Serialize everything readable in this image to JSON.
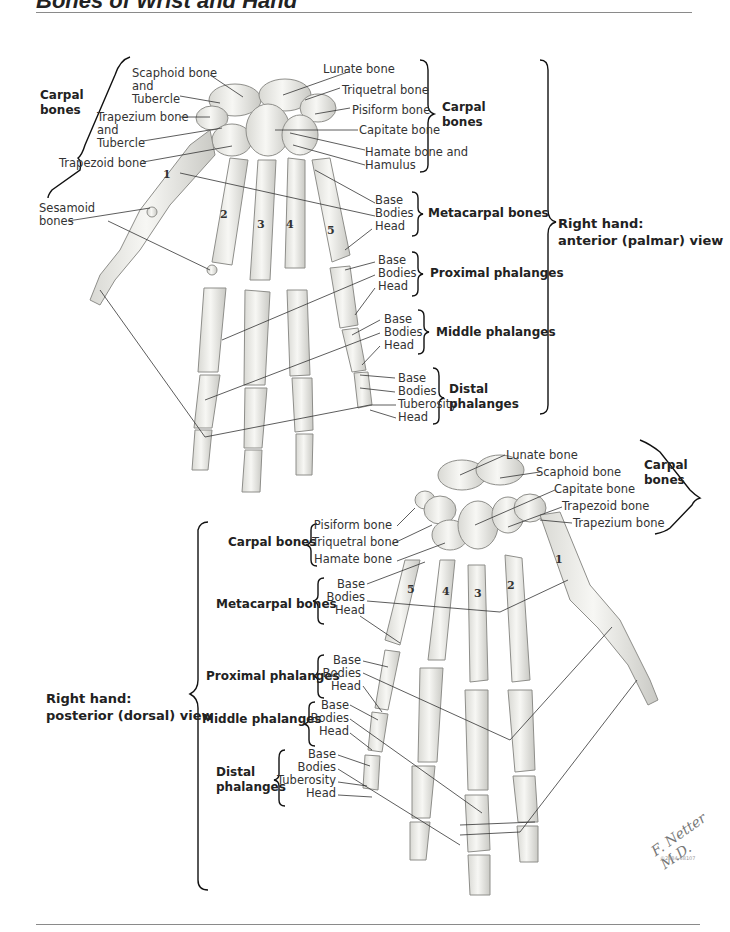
{
  "header": {
    "title": "Bones of Wrist and Hand"
  },
  "anterior_view": {
    "view_label": [
      "Right hand:",
      "anterior (palmar) view"
    ],
    "left_group": {
      "title": [
        "Carpal",
        "bones"
      ]
    },
    "left_labels": [
      "Scaphoid bone",
      "and",
      "Tubercle",
      "Trapezium bone",
      "and",
      "Tubercle",
      "Trapezoid bone",
      "Sesamoid",
      "bones"
    ],
    "right_labels": {
      "carpal": [
        "Lunate bone",
        "Triquetral bone",
        "Pisiform bone",
        "Capitate bone",
        "Hamate bone and",
        "Hamulus"
      ],
      "carpal_group": [
        "Carpal",
        "bones"
      ],
      "metacarpal": [
        "Base",
        "Bodies",
        "Head"
      ],
      "metacarpal_group": "Metacarpal bones",
      "proximal": [
        "Base",
        "Bodies",
        "Head"
      ],
      "proximal_group": "Proximal phalanges",
      "middle": [
        "Base",
        "Bodies",
        "Head"
      ],
      "middle_group": "Middle phalanges",
      "distal": [
        "Base",
        "Bodies",
        "Tuberosity",
        "Head"
      ],
      "distal_group": [
        "Distal",
        "phalanges"
      ]
    },
    "digit_numbers": [
      "1",
      "2",
      "3",
      "4",
      "5"
    ]
  },
  "posterior_view": {
    "view_label": [
      "Right hand:",
      "posterior (dorsal) view"
    ],
    "top_right_labels": [
      "Lunate bone",
      "Scaphoid bone",
      "Capitate bone",
      "Trapezoid bone",
      "Trapezium bone"
    ],
    "top_right_group": [
      "Carpal",
      "bones"
    ],
    "carpal_group": "Carpal bones",
    "carpal": [
      "Pisiform bone",
      "Triquetral bone",
      "Hamate bone"
    ],
    "metacarpal_group": "Metacarpal bones",
    "metacarpal": [
      "Base",
      "Bodies",
      "Head"
    ],
    "proximal_group": "Proximal phalanges",
    "proximal": [
      "Base",
      "Bodies",
      "Head"
    ],
    "middle_group": "Middle phalanges",
    "middle": [
      "Base",
      "Bodies",
      "Head"
    ],
    "distal_group": [
      "Distal",
      "phalanges"
    ],
    "distal": [
      "Base",
      "Bodies",
      "Tuberosity",
      "Head"
    ],
    "digit_numbers": [
      "1",
      "2",
      "3",
      "4",
      "5"
    ]
  },
  "signature": {
    "name": "F. Netter M.D.",
    "code": "©2384-58107"
  }
}
